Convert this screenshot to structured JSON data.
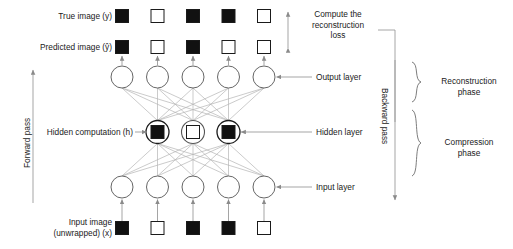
{
  "diagram": {
    "colors": {
      "ink": "#1a1a1a",
      "filled_pixel": "#111111",
      "empty_pixel": "#ffffff",
      "pixel_border": "#1a1a1a",
      "node_stroke": "#555555",
      "connection": "#b5b5b5",
      "arrow": "#8a8a8a",
      "bracket": "#6e6e6e"
    },
    "labels": {
      "true_image": "True image (y)",
      "predicted_image": "Predicted image (ŷ)",
      "hidden_computation": "Hidden computation (h)",
      "input_image_line1": "Input image",
      "input_image_line2": "(unwrapped) (x)",
      "output_layer": "Output layer",
      "hidden_layer": "Hidden layer",
      "input_layer": "Input layer",
      "compute_loss_line1": "Compute the",
      "compute_loss_line2": "reconstruction",
      "compute_loss_line3": "loss",
      "forward_pass": "Forward pass",
      "backward_pass": "Backward pass",
      "reconstruction_phase_line1": "Reconstruction",
      "reconstruction_phase_line2": "phase",
      "compression_phase_line1": "Compression",
      "compression_phase_line2": "phase"
    },
    "rows": {
      "true_image_pixels": [
        "filled",
        "empty",
        "filled",
        "filled",
        "empty"
      ],
      "predicted_image_pixels": [
        "filled",
        "empty",
        "filled",
        "empty",
        "empty"
      ],
      "input_image_pixels": [
        "filled",
        "empty",
        "filled",
        "filled",
        "empty"
      ],
      "hidden_pixels": [
        "filled",
        "empty",
        "filled"
      ]
    },
    "network": {
      "output_layer_nodes": 5,
      "hidden_layer_nodes": 3,
      "input_layer_nodes": 5,
      "columns_x": [
        122,
        157.5,
        193,
        228.5,
        264
      ],
      "hidden_x": [
        157.5,
        193,
        228.5
      ],
      "output_layer_y": 77,
      "hidden_layer_y": 132,
      "input_layer_y": 187,
      "true_row_y": 16,
      "predicted_row_y": 47,
      "input_row_y": 228,
      "node_radius": 11,
      "hidden_node_radius": 11.5,
      "pixel_size": 13
    }
  }
}
